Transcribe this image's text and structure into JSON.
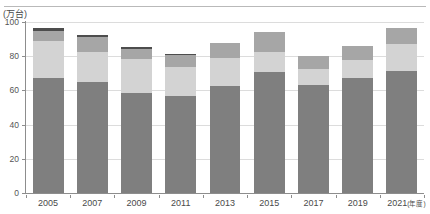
{
  "chart_data": {
    "type": "bar",
    "stacked": true,
    "title": "",
    "subtitle": "",
    "xlabel": "年度",
    "ylabel": "",
    "unit_label": "(万台)",
    "x_axis_suffix": "(年度)",
    "categories": [
      "2005",
      "2007",
      "2009",
      "2011",
      "2013",
      "2015",
      "2017",
      "2019",
      "2021"
    ],
    "tick_labels": [
      "2005",
      "2007",
      "2009",
      "2011",
      "2013",
      "2015",
      "2017",
      "2019",
      "2021"
    ],
    "last_tick_label_full": "2021(年度)",
    "ylim": [
      0,
      100
    ],
    "yticks": [
      0,
      20,
      40,
      60,
      80,
      100
    ],
    "ytick_labels": [
      "0",
      "20",
      "40",
      "60",
      "80",
      "100"
    ],
    "grid": true,
    "grid_axis": "y",
    "legend": false,
    "legend_position": "none",
    "series": [
      {
        "name": "seg1",
        "color": "#7f7f7f",
        "values": [
          67.0,
          65.0,
          58.5,
          57.0,
          62.5,
          70.5,
          63.0,
          67.5,
          71.5
        ]
      },
      {
        "name": "seg2",
        "color": "#d3d3d3",
        "values": [
          22.0,
          17.5,
          20.0,
          16.5,
          16.5,
          12.0,
          9.5,
          10.0,
          15.5
        ]
      },
      {
        "name": "seg3",
        "color": "#a6a6a6",
        "values": [
          6.0,
          8.5,
          6.0,
          7.0,
          8.5,
          11.5,
          7.5,
          8.5,
          9.5
        ]
      },
      {
        "name": "seg4",
        "color": "#4d4d4d",
        "values": [
          1.5,
          1.5,
          1.0,
          0.8,
          0.0,
          0.0,
          0.0,
          0.0,
          0.0
        ]
      }
    ],
    "totals": [
      96.5,
      92.5,
      85.5,
      81.3,
      87.5,
      94.0,
      80.0,
      86.0,
      96.5
    ],
    "colors": {
      "seg1": "#7f7f7f",
      "seg2": "#d3d3d3",
      "seg3": "#a6a6a6",
      "seg4": "#4d4d4d",
      "axis": "#8d8d8d",
      "grid": "#dcdcdc",
      "text": "#4a4a4a",
      "rule": "#b9b9b9",
      "background": "#ffffff"
    }
  }
}
